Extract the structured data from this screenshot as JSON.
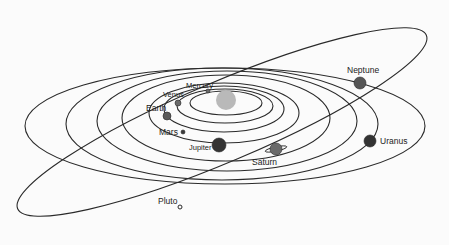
{
  "diagram": {
    "type": "solar-system-orbits",
    "colors": {
      "background": "#fbfbfb",
      "orbit_stroke": "#2a2a2a",
      "sun": "#b9b9b9",
      "planet_dark": "#3a3a3a",
      "planet_mid": "#6a6a6a"
    },
    "sun": {
      "name": "Sun",
      "cx": 226,
      "cy": 100,
      "r": 10
    },
    "orbits": [
      {
        "name": "Mercury",
        "cx": 226,
        "cy": 103,
        "rx": 36,
        "ry": 12
      },
      {
        "name": "Venus",
        "cx": 225,
        "cy": 106,
        "rx": 48,
        "ry": 17
      },
      {
        "name": "Earth",
        "cx": 224,
        "cy": 109,
        "rx": 60,
        "ry": 23
      },
      {
        "name": "Mars",
        "cx": 224,
        "cy": 113,
        "rx": 75,
        "ry": 30
      },
      {
        "name": "Jupiter",
        "cx": 226,
        "cy": 118,
        "rx": 104,
        "ry": 43
      },
      {
        "name": "Saturn",
        "cx": 227,
        "cy": 121,
        "rx": 130,
        "ry": 50
      },
      {
        "name": "Uranus",
        "cx": 222,
        "cy": 124,
        "rx": 156,
        "ry": 56
      },
      {
        "name": "Neptune",
        "cx": 225,
        "cy": 126,
        "rx": 200,
        "ry": 58
      }
    ],
    "pluto_orbit": {
      "name": "Pluto",
      "cx": 222,
      "cy": 122,
      "rx": 222,
      "ry": 40,
      "rotate": -23
    },
    "planets": [
      {
        "name": "Mercury",
        "label": "Mercury",
        "cx": 208,
        "cy": 91,
        "r": 2,
        "fill": "#6a6a6a",
        "lx": 186,
        "ly": 88,
        "small": true
      },
      {
        "name": "Venus",
        "label": "Venus",
        "cx": 178,
        "cy": 103,
        "r": 3,
        "fill": "#6a6a6a",
        "lx": 163,
        "ly": 97,
        "small": true
      },
      {
        "name": "Earth",
        "label": "Earth",
        "cx": 167,
        "cy": 116,
        "r": 4,
        "fill": "#5a5a5a",
        "lx": 146,
        "ly": 111,
        "small": false
      },
      {
        "name": "Mars",
        "label": "Mars",
        "cx": 183,
        "cy": 132,
        "r": 2,
        "fill": "#3a3a3a",
        "lx": 159,
        "ly": 135,
        "small": false
      },
      {
        "name": "Jupiter",
        "label": "Jupiter",
        "cx": 219,
        "cy": 145,
        "r": 7,
        "fill": "#333333",
        "lx": 189,
        "ly": 150,
        "small": true
      },
      {
        "name": "Saturn",
        "label": "Saturn",
        "cx": 276,
        "cy": 149,
        "r": 6,
        "fill": "#6a6a6a",
        "lx": 252,
        "ly": 165,
        "small": false,
        "ring": true
      },
      {
        "name": "Uranus",
        "label": "Uranus",
        "cx": 370,
        "cy": 141,
        "r": 6,
        "fill": "#333333",
        "lx": 380,
        "ly": 144,
        "small": false
      },
      {
        "name": "Neptune",
        "label": "Neptune",
        "cx": 360,
        "cy": 83,
        "r": 6,
        "fill": "#555555",
        "lx": 347,
        "ly": 73,
        "small": false
      },
      {
        "name": "Pluto",
        "label": "Pluto",
        "cx": 180,
        "cy": 207,
        "r": 2,
        "fill": "#fbfbfb",
        "lx": 158,
        "ly": 204,
        "small": false
      }
    ]
  }
}
